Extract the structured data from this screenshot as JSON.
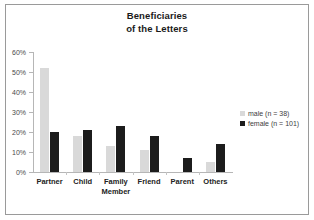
{
  "chart_data": {
    "type": "bar",
    "title": "Beneficiaries of the Letters",
    "title_lines": [
      "Beneficiaries",
      "of the Letters"
    ],
    "categories": [
      "Partner",
      "Child",
      "Family Member",
      "Friend",
      "Parent",
      "Others"
    ],
    "category_lines": [
      [
        "Partner"
      ],
      [
        "Child"
      ],
      [
        "Family",
        "Member"
      ],
      [
        "Friend"
      ],
      [
        "Parent"
      ],
      [
        "Others"
      ]
    ],
    "series": [
      {
        "name": "male (n = 38)",
        "key": "male",
        "color": "#d9d9d9",
        "values": [
          52,
          18,
          13,
          11,
          0,
          5
        ]
      },
      {
        "name": "female (n = 101)",
        "key": "female",
        "color": "#1c1c1c",
        "values": [
          20,
          21,
          23,
          18,
          7,
          14
        ]
      }
    ],
    "xlabel": "",
    "ylabel": "",
    "ylim": [
      0,
      60
    ],
    "ytick_values": [
      0,
      10,
      20,
      30,
      40,
      50,
      60
    ],
    "ytick_labels": [
      "0%",
      "10%",
      "20%",
      "30%",
      "40%",
      "50%",
      "60%"
    ],
    "grid": false,
    "legend_position": "right",
    "value_unit": "percent"
  },
  "legend": {
    "entries": [
      {
        "label": "male (n = 38)",
        "color": "#d9d9d9"
      },
      {
        "label": "female (n = 101)",
        "color": "#1c1c1c"
      }
    ]
  },
  "colors": {
    "male": "#d9d9d9",
    "female": "#1c1c1c",
    "axis": "#b6b6b6",
    "border": "#9a9a9a",
    "background": "#ffffff",
    "text": "#222222"
  }
}
